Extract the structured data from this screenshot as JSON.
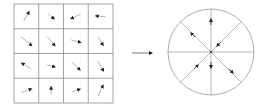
{
  "diagram": {
    "colors": {
      "grid_line": "#8c8c8c",
      "arrow": "#333333",
      "circle": "#9a9a9a",
      "background": "#ffffff"
    },
    "grid": {
      "rows": 4,
      "cols": 4,
      "x": 14,
      "y": 4,
      "cell": 24.75,
      "vectors": [
        [
          {
            "angle": -60,
            "len": 11
          },
          {
            "angle": 40,
            "len": 8
          },
          {
            "angle": 155,
            "len": 11
          },
          {
            "angle": 185,
            "len": 10
          }
        ],
        [
          {
            "angle": 40,
            "len": 14
          },
          {
            "angle": 50,
            "len": 12
          },
          {
            "angle": 15,
            "len": 10
          },
          {
            "angle": 60,
            "len": 10
          }
        ],
        [
          {
            "angle": -150,
            "len": 11
          },
          {
            "angle": 15,
            "len": 8
          },
          {
            "angle": 45,
            "len": 12
          },
          {
            "angle": 60,
            "len": 12
          }
        ],
        [
          {
            "angle": -20,
            "len": 11
          },
          {
            "angle": -90,
            "len": 8
          },
          {
            "angle": -20,
            "len": 9
          },
          {
            "angle": -65,
            "len": 12
          }
        ]
      ]
    },
    "transition_arrow": {
      "x1": 132,
      "y1": 53,
      "x2": 152,
      "y2": 53
    },
    "histogram": {
      "cx": 211,
      "cy": 52,
      "r": 43,
      "bins": 8,
      "arrows": [
        {
          "x": 211,
          "y": 22,
          "angle": -90
        },
        {
          "x": 193,
          "y": 35,
          "angle": -135
        },
        {
          "x": 219,
          "y": 44,
          "angle": 135
        },
        {
          "x": 196,
          "y": 67,
          "angle": -45
        },
        {
          "x": 211,
          "y": 65,
          "angle": 90
        },
        {
          "x": 231,
          "y": 71,
          "angle": 45
        }
      ]
    }
  }
}
